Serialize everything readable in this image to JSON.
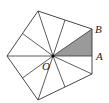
{
  "figure": {
    "type": "regular pentagon divided into 10 triangles",
    "labels": {
      "center": "O",
      "vertex": "B",
      "midpoint": "A"
    },
    "colors": {
      "stroke": "#333333",
      "shade": "#9a9a9a",
      "background": "#ffffff"
    }
  }
}
